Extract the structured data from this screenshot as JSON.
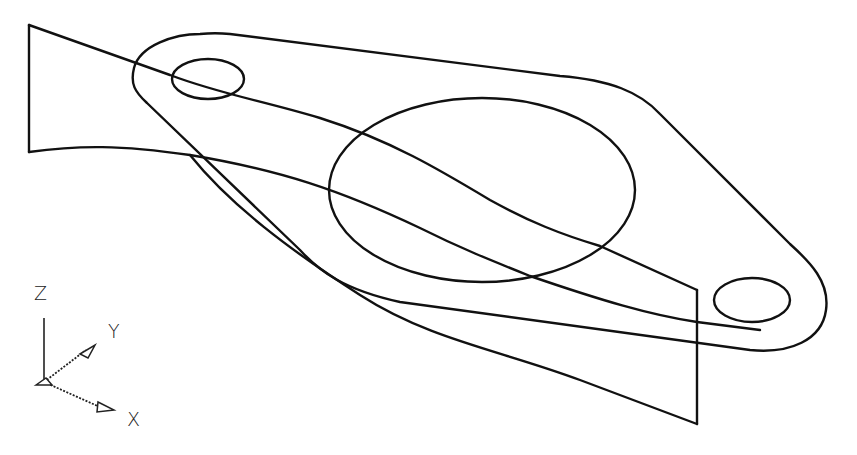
{
  "diagram": {
    "type": "isometric-wireframe",
    "line_color": "#111111",
    "background": "#ffffff"
  },
  "ucs_icon": {
    "axes": [
      {
        "name": "Z",
        "label": "Z"
      },
      {
        "name": "Y",
        "label": "Y"
      },
      {
        "name": "X",
        "label": "X"
      }
    ]
  },
  "elements": {
    "flange_outline": "flange-outline",
    "bolt_hole_left": "bolt-hole-left",
    "bolt_hole_right": "bolt-hole-right",
    "center_bore": "center-bore",
    "twisted_surface": "twisted-surface"
  }
}
